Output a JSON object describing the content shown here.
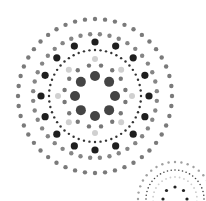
{
  "canvas": {
    "width": 206,
    "height": 201,
    "background": "#ffffff"
  },
  "main_mandala": {
    "center": [
      95,
      96
    ],
    "rings": [
      {
        "name": "outer-ring",
        "radius": 77,
        "count": 48,
        "dot_r": 2.2,
        "color": "#7a7a7a",
        "offset": 0
      },
      {
        "name": "second-ring",
        "radius": 62,
        "count": 40,
        "dot_r": 2.2,
        "color": "#858585",
        "offset": 4.5
      },
      {
        "name": "dark-dot-ring",
        "radius": 54,
        "count": 16,
        "dot_r": 3.6,
        "color": "#1f1f1f",
        "offset": 0
      },
      {
        "name": "fine-dotted-ring",
        "radius": 46,
        "count": 52,
        "dot_r": 1.2,
        "color": "#333333",
        "offset": 0
      },
      {
        "name": "pale-ring",
        "radius": 37,
        "count": 8,
        "dot_r": 3.0,
        "color": "#d0d0d0",
        "offset": 0
      },
      {
        "name": "medium-ring",
        "radius": 31,
        "count": 16,
        "dot_r": 2.2,
        "color": "#777777",
        "offset": 11.25
      },
      {
        "name": "inner-large-ring",
        "radius": 20,
        "count": 8,
        "dot_r": 5.0,
        "color": "#444444",
        "offset": 0
      }
    ]
  },
  "mini_mandala": {
    "center": [
      175,
      199
    ],
    "rings": [
      {
        "name": "mini-outer-ring",
        "radius": 37,
        "count": 36,
        "dot_r": 1.2,
        "color": "#a0a0a0",
        "offset": 0
      },
      {
        "name": "mini-fine-dotted-ring",
        "radius": 29,
        "count": 48,
        "dot_r": 0.8,
        "color": "#444444",
        "offset": 0
      },
      {
        "name": "mini-pale-ring",
        "radius": 22,
        "count": 30,
        "dot_r": 0.9,
        "color": "#cccccc",
        "offset": 0
      },
      {
        "name": "mini-dark-ring",
        "radius": 12,
        "count": 8,
        "dot_r": 1.6,
        "color": "#222222",
        "offset": 0
      }
    ]
  }
}
